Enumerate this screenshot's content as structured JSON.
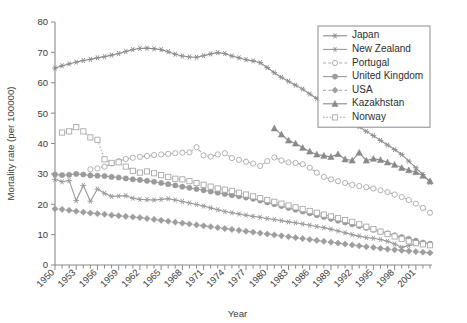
{
  "chart_data": {
    "type": "line",
    "title": "",
    "xlabel": "Year",
    "ylabel": "Mortality rate (per 100000)",
    "xlim": [
      1950,
      2003
    ],
    "ylim": [
      0,
      80
    ],
    "yticks": [
      0,
      10,
      20,
      30,
      40,
      50,
      60,
      70,
      80
    ],
    "xticks": [
      1950,
      1953,
      1956,
      1959,
      1962,
      1965,
      1968,
      1971,
      1974,
      1977,
      1980,
      1983,
      1986,
      1989,
      1992,
      1995,
      1998,
      2001
    ],
    "xtick_minor_step": 1,
    "grid": false,
    "legend_position": "top-right",
    "series": [
      {
        "name": "Japan",
        "marker": "star",
        "dash": "solid",
        "color": "#8c8c8c",
        "x": [
          1950,
          1951,
          1952,
          1953,
          1954,
          1955,
          1956,
          1957,
          1958,
          1959,
          1960,
          1961,
          1962,
          1963,
          1964,
          1965,
          1966,
          1967,
          1968,
          1969,
          1970,
          1971,
          1972,
          1973,
          1974,
          1975,
          1976,
          1977,
          1978,
          1979,
          1980,
          1981,
          1982,
          1983,
          1984,
          1985,
          1986,
          1987,
          1988,
          1989,
          1990,
          1991,
          1992,
          1993,
          1994,
          1995,
          1996,
          1997,
          1998,
          1999,
          2000,
          2001,
          2002,
          2003
        ],
        "values": [
          64.8,
          65.6,
          66.2,
          66.8,
          67.3,
          67.7,
          68.2,
          68.6,
          69.1,
          69.6,
          70.3,
          70.9,
          71.3,
          71.4,
          71.2,
          70.9,
          70.2,
          69.4,
          68.8,
          68.5,
          68.4,
          68.9,
          69.5,
          69.9,
          69.6,
          68.8,
          68.2,
          67.6,
          67.2,
          66.6,
          65.0,
          63.3,
          61.8,
          60.5,
          59.2,
          57.9,
          56.3,
          54.8,
          53.3,
          51.8,
          50.2,
          48.6,
          47.1,
          45.5,
          44.0,
          42.6,
          41.0,
          39.5,
          38.0,
          36.4,
          34.2,
          32.0,
          29.8,
          27.2
        ]
      },
      {
        "name": "New Zealand",
        "marker": "asterisk",
        "dash": "solid",
        "color": "#9a9a9a",
        "x": [
          1950,
          1951,
          1952,
          1953,
          1954,
          1955,
          1956,
          1957,
          1958,
          1959,
          1960,
          1961,
          1962,
          1963,
          1964,
          1965,
          1966,
          1967,
          1968,
          1969,
          1970,
          1971,
          1972,
          1973,
          1974,
          1975,
          1976,
          1977,
          1978,
          1979,
          1980,
          1981,
          1982,
          1983,
          1984,
          1985,
          1986,
          1987,
          1988,
          1989,
          1990,
          1991,
          1992,
          1993,
          1994,
          1995,
          1996,
          1997,
          1998,
          1999,
          2000,
          2001,
          2002,
          2003
        ],
        "values": [
          28.2,
          27.4,
          27.8,
          21.2,
          26.2,
          21.0,
          25.0,
          23.6,
          22.6,
          22.7,
          22.8,
          22.0,
          21.6,
          21.5,
          21.4,
          21.6,
          21.8,
          21.4,
          20.9,
          20.4,
          19.9,
          19.4,
          18.8,
          18.2,
          17.6,
          17.2,
          16.8,
          16.4,
          16.0,
          15.7,
          15.3,
          15.0,
          14.6,
          14.2,
          13.9,
          13.5,
          13.1,
          12.7,
          12.3,
          11.8,
          11.2,
          10.6,
          10.0,
          9.5,
          9.0,
          8.8,
          8.4,
          7.8,
          6.9,
          5.8,
          6.4,
          7.0,
          7.2,
          7.0
        ]
      },
      {
        "name": "Portugal",
        "marker": "circle-open",
        "dash": "dashed",
        "color": "#a9a9a9",
        "x": [
          1955,
          1956,
          1957,
          1958,
          1959,
          1960,
          1961,
          1962,
          1963,
          1964,
          1965,
          1966,
          1967,
          1968,
          1969,
          1970,
          1971,
          1972,
          1973,
          1974,
          1975,
          1976,
          1977,
          1978,
          1979,
          1980,
          1981,
          1982,
          1983,
          1984,
          1985,
          1986,
          1987,
          1988,
          1989,
          1990,
          1991,
          1992,
          1993,
          1994,
          1995,
          1996,
          1997,
          1998,
          1999,
          2000,
          2001,
          2002,
          2003
        ],
        "values": [
          31.5,
          31.8,
          32.4,
          33.4,
          34.2,
          34.9,
          35.3,
          35.6,
          35.9,
          36.2,
          36.4,
          36.6,
          36.8,
          37.0,
          37.1,
          38.8,
          36.1,
          35.7,
          36.4,
          36.8,
          35.2,
          34.6,
          34.0,
          33.4,
          32.6,
          34.2,
          35.4,
          34.4,
          33.8,
          33.6,
          33.2,
          32.0,
          30.4,
          29.0,
          28.2,
          27.6,
          27.0,
          26.4,
          26.0,
          25.6,
          25.2,
          24.6,
          24.0,
          23.2,
          22.4,
          21.4,
          20.2,
          18.8,
          17.2
        ]
      },
      {
        "name": "United Kingdom",
        "marker": "circle-filled",
        "dash": "solid",
        "color": "#9a9a9a",
        "x": [
          1950,
          1951,
          1952,
          1953,
          1954,
          1955,
          1956,
          1957,
          1958,
          1959,
          1960,
          1961,
          1962,
          1963,
          1964,
          1965,
          1966,
          1967,
          1968,
          1969,
          1970,
          1971,
          1972,
          1973,
          1974,
          1975,
          1976,
          1977,
          1978,
          1979,
          1980,
          1981,
          1982,
          1983,
          1984,
          1985,
          1986,
          1987,
          1988,
          1989,
          1990,
          1991,
          1992,
          1993,
          1994,
          1995,
          1996,
          1997,
          1998,
          1999,
          2000,
          2001,
          2002,
          2003
        ],
        "values": [
          29.8,
          29.6,
          29.7,
          30.0,
          29.8,
          29.5,
          29.4,
          29.3,
          29.0,
          28.8,
          28.5,
          28.2,
          28.0,
          27.7,
          27.4,
          27.0,
          26.6,
          26.2,
          25.8,
          25.4,
          25.0,
          24.6,
          24.2,
          23.8,
          23.4,
          23.0,
          22.6,
          22.2,
          21.8,
          21.2,
          20.6,
          20.0,
          19.4,
          18.8,
          18.2,
          17.6,
          17.0,
          16.4,
          15.8,
          15.2,
          14.6,
          14.0,
          13.4,
          12.8,
          12.2,
          11.6,
          11.0,
          10.4,
          9.8,
          9.2,
          8.6,
          8.0,
          7.4,
          7.0
        ]
      },
      {
        "name": "USA",
        "marker": "diamond-filled",
        "dash": "dashed",
        "color": "#9e9e9e",
        "x": [
          1950,
          1951,
          1952,
          1953,
          1954,
          1955,
          1956,
          1957,
          1958,
          1959,
          1960,
          1961,
          1962,
          1963,
          1964,
          1965,
          1966,
          1967,
          1968,
          1969,
          1970,
          1971,
          1972,
          1973,
          1974,
          1975,
          1976,
          1977,
          1978,
          1979,
          1980,
          1981,
          1982,
          1983,
          1984,
          1985,
          1986,
          1987,
          1988,
          1989,
          1990,
          1991,
          1992,
          1993,
          1994,
          1995,
          1996,
          1997,
          1998,
          1999,
          2000,
          2001,
          2002,
          2003
        ],
        "values": [
          18.5,
          18.3,
          18.0,
          17.7,
          17.4,
          17.1,
          16.9,
          16.7,
          16.4,
          16.2,
          16.0,
          15.8,
          15.6,
          15.3,
          15.0,
          14.7,
          14.4,
          14.1,
          13.8,
          13.5,
          13.2,
          12.9,
          12.6,
          12.3,
          12.0,
          11.7,
          11.4,
          11.1,
          10.8,
          10.5,
          10.2,
          9.9,
          9.6,
          9.3,
          9.0,
          8.7,
          8.4,
          8.1,
          7.8,
          7.5,
          7.2,
          6.9,
          6.6,
          6.3,
          6.0,
          5.8,
          5.5,
          5.2,
          5.0,
          4.8,
          4.6,
          4.4,
          4.2,
          4.0
        ]
      },
      {
        "name": "Kazakhstan",
        "marker": "triangle-filled",
        "dash": "solid",
        "color": "#8a8a8a",
        "x": [
          1981,
          1982,
          1983,
          1984,
          1985,
          1986,
          1987,
          1988,
          1989,
          1990,
          1991,
          1992,
          1993,
          1994,
          1995,
          1996,
          1997,
          1998,
          1999,
          2000,
          2001,
          2002,
          2003
        ],
        "values": [
          45.0,
          43.0,
          41.0,
          40.0,
          38.6,
          37.4,
          36.4,
          36.0,
          35.6,
          36.5,
          34.8,
          34.4,
          37.0,
          34.4,
          35.0,
          34.6,
          33.8,
          33.0,
          32.0,
          31.2,
          30.6,
          29.4,
          27.6
        ]
      },
      {
        "name": "Norway",
        "marker": "square-open",
        "dash": "dotted",
        "color": "#a9a9a9",
        "x": [
          1951,
          1952,
          1953,
          1954,
          1955,
          1956,
          1957,
          1958,
          1959,
          1960,
          1961,
          1962,
          1963,
          1964,
          1965,
          1966,
          1967,
          1968,
          1969,
          1970,
          1971,
          1972,
          1973,
          1974,
          1975,
          1976,
          1977,
          1978,
          1979,
          1980,
          1981,
          1982,
          1983,
          1984,
          1985,
          1986,
          1987,
          1988,
          1989,
          1990,
          1991,
          1992,
          1993,
          1994,
          1995,
          1996,
          1997,
          1998,
          1999,
          2000,
          2001,
          2002,
          2003
        ],
        "values": [
          43.6,
          44.0,
          45.4,
          44.0,
          42.0,
          41.2,
          34.8,
          33.6,
          33.8,
          32.4,
          31.0,
          30.4,
          30.8,
          30.2,
          29.6,
          29.0,
          28.4,
          28.2,
          27.6,
          27.0,
          26.4,
          25.8,
          25.2,
          24.8,
          24.4,
          23.8,
          23.2,
          22.6,
          22.0,
          21.4,
          20.8,
          20.2,
          19.6,
          19.0,
          18.4,
          17.8,
          17.2,
          16.6,
          16.0,
          15.4,
          14.8,
          14.2,
          13.4,
          12.6,
          11.8,
          11.0,
          10.2,
          9.4,
          8.6,
          7.8,
          7.2,
          6.8,
          6.5
        ]
      }
    ]
  },
  "legend": {
    "items": [
      {
        "label": "Japan"
      },
      {
        "label": "New Zealand"
      },
      {
        "label": "Portugal"
      },
      {
        "label": "United Kingdom"
      },
      {
        "label": "USA"
      },
      {
        "label": "Kazakhstan"
      },
      {
        "label": "Norway"
      }
    ]
  }
}
